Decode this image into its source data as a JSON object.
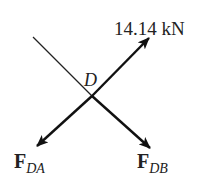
{
  "diagram": {
    "type": "free-body-diagram",
    "point": "D",
    "applied_force": {
      "label": "14.14 kN",
      "direction": "up-right"
    },
    "forces": [
      {
        "symbol": "F",
        "subscript": "DA",
        "direction": "down-left"
      },
      {
        "symbol": "F",
        "subscript": "DB",
        "direction": "down-right"
      }
    ],
    "reference_line": {
      "direction": "up-left",
      "style": "thin"
    },
    "colors": {
      "line": "#111111",
      "background": "#ffffff"
    }
  }
}
